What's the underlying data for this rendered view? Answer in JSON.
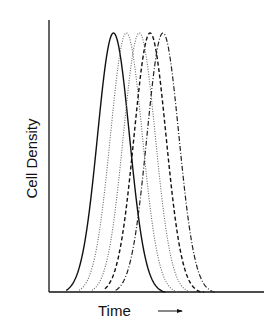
{
  "chart_data": {
    "type": "line",
    "title": "",
    "xlabel": "Time",
    "ylabel": "Cell Density",
    "x_axis_arrow": "right-arrow",
    "grid": false,
    "legend": null,
    "axis_ticks": "none",
    "series": [
      {
        "name": "curve-1",
        "style": "solid",
        "peak_x": 0.3,
        "left_start": 0.08,
        "right_end": 0.54
      },
      {
        "name": "curve-2",
        "style": "dotted",
        "peak_x": 0.36,
        "left_start": 0.14,
        "right_end": 0.6
      },
      {
        "name": "curve-3",
        "style": "dotted",
        "peak_x": 0.42,
        "left_start": 0.2,
        "right_end": 0.66
      },
      {
        "name": "curve-4",
        "style": "dashed",
        "peak_x": 0.47,
        "left_start": 0.26,
        "right_end": 0.72
      },
      {
        "name": "curve-5",
        "style": "dash-dot",
        "peak_x": 0.53,
        "left_start": 0.31,
        "right_end": 0.77
      }
    ],
    "xlim": [
      0,
      1
    ],
    "ylim": [
      0,
      1.05
    ],
    "peak_height": 1.0
  }
}
